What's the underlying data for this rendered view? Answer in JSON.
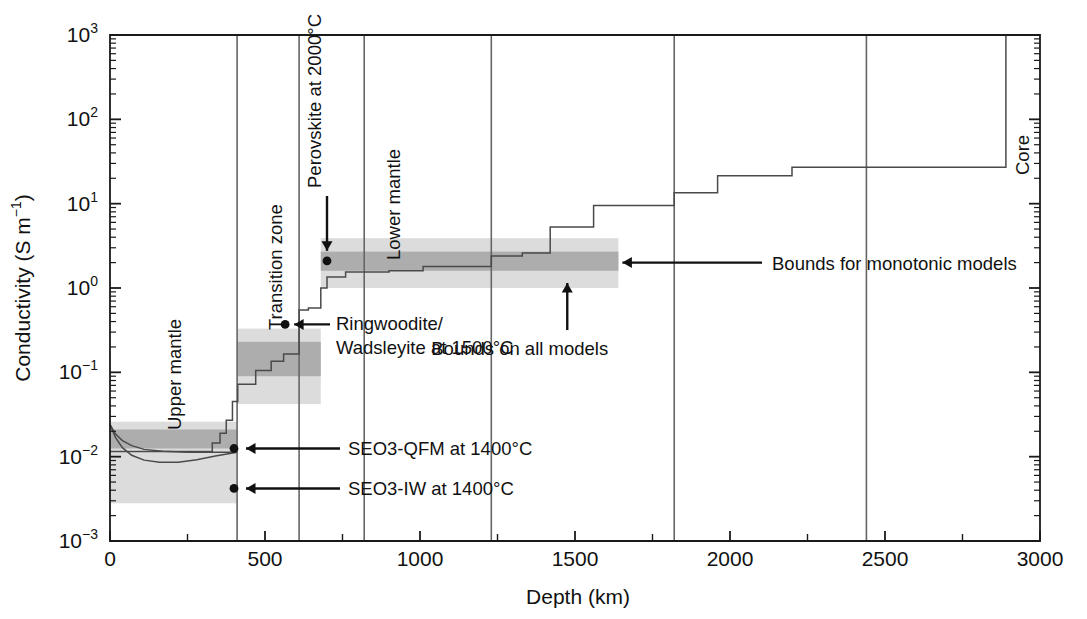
{
  "chart_data": {
    "type": "line",
    "title": "",
    "xlabel": "Depth (km)",
    "ylabel": "Conductivity (S m⁻¹)",
    "xlim": [
      0,
      3000
    ],
    "ylim": [
      0.001,
      1000
    ],
    "yscale": "log",
    "grid": false,
    "legend": "none",
    "x_ticks": [
      0,
      500,
      1000,
      1500,
      2000,
      2500,
      3000
    ],
    "x_tick_labels": [
      "0",
      "500",
      "1000",
      "1500",
      "2000",
      "2500",
      "3000"
    ],
    "y_ticks": [
      0.001,
      0.01,
      0.1,
      1,
      10,
      100,
      1000
    ],
    "y_tick_labels": [
      "10⁻³",
      "10⁻²",
      "10⁻¹",
      "10⁰",
      "10¹",
      "10²",
      "10³"
    ],
    "y_tick_mantissa": "10",
    "y_tick_exponents": [
      "-3",
      "-2",
      "-1",
      "0",
      "1",
      "2",
      "3"
    ],
    "region_labels": [
      {
        "text": "Upper mantle",
        "depth_km": 230,
        "rotated": true
      },
      {
        "text": "Transition zone",
        "depth_km": 555,
        "rotated": true
      },
      {
        "text": "Lower mantle",
        "depth_km": 935,
        "rotated": true
      },
      {
        "text": "Core",
        "depth_km": 2965,
        "rotated": true
      }
    ],
    "region_boundaries_km": [
      410,
      610,
      820,
      1230,
      1820,
      2440
    ],
    "core_boundary_km": 2890,
    "annotations": [
      {
        "text": "Perovskite at 2000°C",
        "arrow": "down",
        "point": {
          "depth_km": 700,
          "conductivity": 2.1
        }
      },
      {
        "text": "Ringwoodite/",
        "text2": "Wadsleyite at 1500°C",
        "arrow": "left",
        "point": {
          "depth_km": 565,
          "conductivity": 0.37
        }
      },
      {
        "text": "Bounds for monotonic models",
        "arrow": "left",
        "target": {
          "depth_km": 1640,
          "conductivity": 2.0
        }
      },
      {
        "text": "Bounds on all models",
        "arrow": "up",
        "target": {
          "depth_km": 1475,
          "conductivity": 1.35
        }
      },
      {
        "text": "SEO3-QFM at 1400°C",
        "arrow": "left",
        "point": {
          "depth_km": 400,
          "conductivity": 0.0125
        }
      },
      {
        "text": "SEO3-IW at 1400°C",
        "arrow": "left",
        "point": {
          "depth_km": 400,
          "conductivity": 0.0042
        }
      }
    ],
    "data_points": [
      {
        "name": "perovskite-2000C",
        "depth_km": 700,
        "conductivity": 2.1
      },
      {
        "name": "ringwoodite-wadsleyite-1500C",
        "depth_km": 565,
        "conductivity": 0.37
      },
      {
        "name": "seo3-qfm-1400C",
        "depth_km": 400,
        "conductivity": 0.0125
      },
      {
        "name": "seo3-iw-1400C",
        "depth_km": 400,
        "conductivity": 0.0042
      }
    ],
    "series": [
      {
        "name": "model-staircase",
        "style": "step",
        "steps": [
          {
            "x0": 0,
            "x1": 330,
            "y": 0.0115
          },
          {
            "x0": 330,
            "x1": 355,
            "y": 0.0145
          },
          {
            "x0": 355,
            "x1": 375,
            "y": 0.019
          },
          {
            "x0": 375,
            "x1": 395,
            "y": 0.027
          },
          {
            "x0": 395,
            "x1": 412,
            "y": 0.045
          },
          {
            "x0": 412,
            "x1": 470,
            "y": 0.072
          },
          {
            "x0": 470,
            "x1": 520,
            "y": 0.105
          },
          {
            "x0": 520,
            "x1": 560,
            "y": 0.135
          },
          {
            "x0": 560,
            "x1": 610,
            "y": 0.165
          },
          {
            "x0": 610,
            "x1": 640,
            "y": 0.55
          },
          {
            "x0": 640,
            "x1": 680,
            "y": 0.58
          },
          {
            "x0": 680,
            "x1": 700,
            "y": 1.0
          },
          {
            "x0": 700,
            "x1": 760,
            "y": 1.35
          },
          {
            "x0": 760,
            "x1": 900,
            "y": 1.55
          },
          {
            "x0": 900,
            "x1": 1010,
            "y": 1.6
          },
          {
            "x0": 1010,
            "x1": 1230,
            "y": 1.8
          },
          {
            "x0": 1230,
            "x1": 1330,
            "y": 2.4
          },
          {
            "x0": 1330,
            "x1": 1420,
            "y": 2.6
          },
          {
            "x0": 1420,
            "x1": 1560,
            "y": 5.3
          },
          {
            "x0": 1560,
            "x1": 1820,
            "y": 9.5
          },
          {
            "x0": 1820,
            "x1": 1960,
            "y": 13.5
          },
          {
            "x0": 1960,
            "x1": 2200,
            "y": 21.5
          },
          {
            "x0": 2200,
            "x1": 2890,
            "y": 27.0
          },
          {
            "x0": 2890,
            "x1": 3000,
            "y": 1000.0
          }
        ]
      },
      {
        "name": "seo3-curve-upper",
        "style": "smooth",
        "points": [
          [
            0,
            0.024
          ],
          [
            18,
            0.0185
          ],
          [
            40,
            0.0155
          ],
          [
            70,
            0.0135
          ],
          [
            110,
            0.0122
          ],
          [
            170,
            0.0116
          ],
          [
            250,
            0.0113
          ],
          [
            340,
            0.0113
          ],
          [
            410,
            0.0113
          ]
        ]
      },
      {
        "name": "seo3-curve-lower",
        "style": "smooth",
        "points": [
          [
            0,
            0.024
          ],
          [
            18,
            0.0168
          ],
          [
            40,
            0.0128
          ],
          [
            70,
            0.0104
          ],
          [
            110,
            0.0091
          ],
          [
            160,
            0.0086
          ],
          [
            220,
            0.0086
          ],
          [
            280,
            0.0092
          ],
          [
            340,
            0.0102
          ],
          [
            410,
            0.0113
          ]
        ]
      }
    ],
    "bands": [
      {
        "name": "bounds-on-all-models-upper-mantle",
        "shade": "light",
        "color": "#dcdcdc",
        "x0": 0,
        "x1": 410,
        "y0": 0.0028,
        "y1": 0.026
      },
      {
        "name": "bounds-for-monotonic-models-upper-mantle",
        "shade": "dark",
        "color": "#adadad",
        "x0": 0,
        "x1": 410,
        "y0": 0.0125,
        "y1": 0.021
      },
      {
        "name": "bounds-on-all-models-transition",
        "shade": "light",
        "color": "#dcdcdc",
        "x0": 410,
        "x1": 680,
        "y0": 0.042,
        "y1": 0.33
      },
      {
        "name": "bounds-for-monotonic-models-transition",
        "shade": "dark",
        "color": "#adadad",
        "x0": 410,
        "x1": 680,
        "y0": 0.09,
        "y1": 0.23
      },
      {
        "name": "bounds-on-all-models-lower-mantle",
        "shade": "light",
        "color": "#dcdcdc",
        "x0": 680,
        "x1": 1640,
        "y0": 1.0,
        "y1": 3.9
      },
      {
        "name": "bounds-for-monotonic-models-lower-mantle",
        "shade": "dark",
        "color": "#adadad",
        "x0": 680,
        "x1": 1640,
        "y0": 1.6,
        "y1": 2.7
      }
    ],
    "colors": {
      "axis": "#1a1a1a",
      "line": "#4a4a4a",
      "band_light": "#dcdcdc",
      "band_dark": "#adadad",
      "text": "#111111"
    }
  }
}
